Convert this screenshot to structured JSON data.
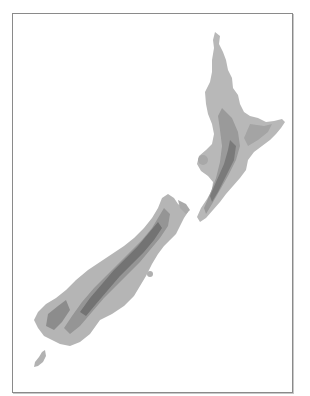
{
  "map": {
    "subject": "New Zealand shaded relief",
    "regions": [
      {
        "name": "North Island"
      },
      {
        "name": "South Island"
      },
      {
        "name": "Stewart Island"
      }
    ],
    "colors": {
      "background": "#ffffff",
      "frame": "#8a8a8a",
      "lowland": "#b9b9b9",
      "midland": "#9e9e9e",
      "highland": "#7c7c7c",
      "ridge": "#6a6a6a"
    }
  }
}
